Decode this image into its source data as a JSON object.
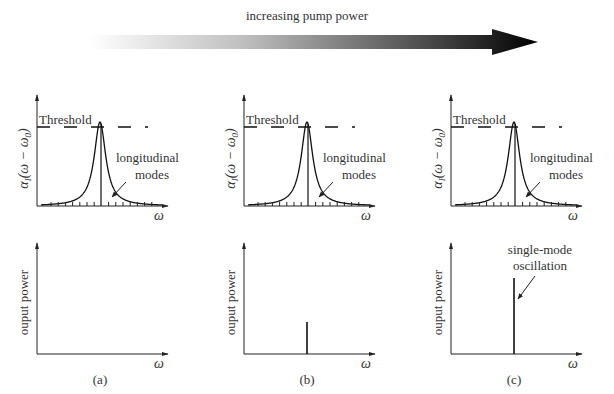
{
  "header": {
    "arrow_label": "increasing pump power",
    "arrow": {
      "x_start": 90,
      "x_shaft_end": 492,
      "x_tip": 538,
      "y_center": 42,
      "shaft_half": 7,
      "head_half": 13,
      "color_start": "#ffffff",
      "color_end": "#000000"
    }
  },
  "axis_labels": {
    "gain_ylabel": "α_I(ω − ω_0)",
    "gain_ylabel_main": "α",
    "gain_ylabel_sub": "I",
    "gain_ylabel_rest": "(ω − ω",
    "gain_ylabel_sub2": "0",
    "gain_ylabel_close": ")",
    "power_ylabel": "ouput power",
    "xlabel": "ω"
  },
  "annotations": {
    "threshold": "Threshold",
    "modes_line1": "longitudinal",
    "modes_line2": "modes",
    "single_line1": "single-mode",
    "single_line2": "oscillation"
  },
  "panels": [
    {
      "id": "a",
      "caption": "(a)",
      "offset_x": 0,
      "spike_height": 0,
      "show_single_annotation": false
    },
    {
      "id": "b",
      "caption": "(b)",
      "offset_x": 207,
      "spike_height": 32,
      "show_single_annotation": false
    },
    {
      "id": "c",
      "caption": "(c)",
      "offset_x": 414,
      "spike_height": 76,
      "show_single_annotation": true
    }
  ],
  "geometry": {
    "gain_axis_x": 37,
    "gain_axis_top": 95,
    "gain_baseline": 206,
    "gain_axis_right": 168,
    "threshold_y": 127,
    "peak_x": 100,
    "peak_y": 122,
    "lorentz_width": 7,
    "power_axis_x": 37,
    "power_axis_top": 243,
    "power_baseline": 354,
    "power_axis_right": 168,
    "spike_x": 100,
    "caption_y": 384
  },
  "chart_data": {
    "type": "diagram",
    "panels": [
      {
        "label": "(a)",
        "gain_peak_vs_threshold": "below",
        "output_power_modes": []
      },
      {
        "label": "(b)",
        "gain_peak_vs_threshold": "at",
        "output_power_modes": [
          {
            "omega": "ω0",
            "relative_power": 0.3
          }
        ]
      },
      {
        "label": "(c)",
        "gain_peak_vs_threshold": "at (clamped)",
        "output_power_modes": [
          {
            "omega": "ω0",
            "relative_power": 0.7
          }
        ]
      }
    ],
    "upper_ylabel": "α_I(ω − ω_0)",
    "lower_ylabel": "ouput power",
    "xlabel": "ω"
  }
}
